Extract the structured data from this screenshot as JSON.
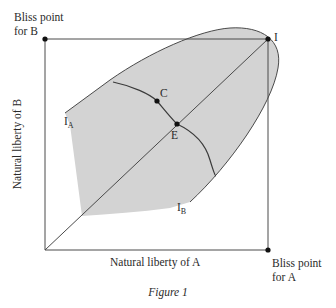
{
  "diagram": {
    "labels": {
      "bliss_b_line1": "Bliss point",
      "bliss_b_line2": "for B",
      "bliss_a_line1": "Bliss point",
      "bliss_a_line2": "for A",
      "point_i": "I",
      "point_c": "C",
      "point_e": "E",
      "curve_ia_main": "I",
      "curve_ia_sub": "A",
      "curve_ib_main": "I",
      "curve_ib_sub": "B",
      "x_axis": "Natural liberty of A",
      "y_axis": "Natural liberty of B"
    },
    "caption": "Figure 1",
    "colors": {
      "shade": "#d3d3d3",
      "line": "#4a4a4a",
      "point": "#111111"
    }
  }
}
